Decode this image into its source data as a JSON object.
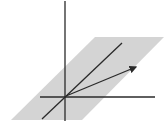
{
  "diagram": {
    "title": "",
    "colors": {
      "background": "#ffffff",
      "plane_fill": "#d4d4d4",
      "axis_stroke": "#2a2a2a",
      "line_stroke": "#2a2a2a",
      "vector_stroke": "#2a2a2a"
    },
    "elements": [
      {
        "id": "plane",
        "type": "parallelogram",
        "label": ""
      },
      {
        "id": "z-axis",
        "type": "axis",
        "label": ""
      },
      {
        "id": "x-axis",
        "type": "axis",
        "label": ""
      },
      {
        "id": "line-in-plane",
        "type": "line",
        "label": ""
      },
      {
        "id": "vector",
        "type": "arrow",
        "label": ""
      }
    ]
  }
}
